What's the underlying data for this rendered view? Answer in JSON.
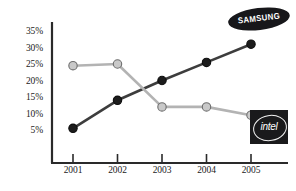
{
  "chart_data": {
    "type": "line",
    "title": "",
    "subtitle": "",
    "xlabel": "",
    "ylabel": "",
    "categories": [
      "2001",
      "2002",
      "2003",
      "2004",
      "2005"
    ],
    "ytick_labels": [
      "35%",
      "30%",
      "25%",
      "20%",
      "15%",
      "10%",
      "5%"
    ],
    "ytick_values": [
      35,
      30,
      25,
      20,
      15,
      10,
      5
    ],
    "ylim": [
      0,
      37
    ],
    "grid": false,
    "legend_position": "inline-endpoint-logos",
    "series": [
      {
        "name": "SAMSUNG",
        "color": "#3d3d3d",
        "marker_color": "#1c1c1c",
        "values": [
          5.5,
          14,
          20,
          25.5,
          31
        ]
      },
      {
        "name": "intel",
        "color": "#b3b3b3",
        "marker_color": "#c9c9c9",
        "values": [
          24.5,
          25,
          12,
          12,
          9.5
        ]
      }
    ],
    "annotations": [
      {
        "name": "samsung-logo",
        "text": "SAMSUNG"
      },
      {
        "name": "intel-logo",
        "text": "intel"
      }
    ]
  },
  "axis": {
    "line_color": "#2a2a2a"
  }
}
